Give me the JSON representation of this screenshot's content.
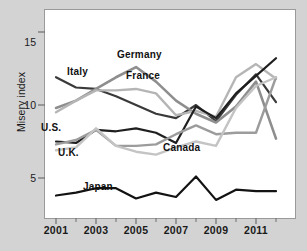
{
  "chart_data": {
    "type": "line",
    "title": "",
    "xlabel": "",
    "ylabel": "Misery index",
    "xlim": [
      2001,
      2012
    ],
    "ylim": [
      2.2,
      16.5
    ],
    "grid": false,
    "legend_position": "inline-labels",
    "x": [
      2001,
      2002,
      2003,
      2004,
      2005,
      2006,
      2007,
      2008,
      2009,
      2010,
      2011,
      2012
    ],
    "xticks": [
      2001,
      2003,
      2005,
      2007,
      2009,
      2011
    ],
    "xtick_labels": [
      "2001",
      "2003",
      "2005",
      "2007",
      "2009",
      "2011"
    ],
    "xminor_ticks": [
      2002,
      2004,
      2006,
      2008,
      2010,
      2012
    ],
    "yticks": [
      5,
      10,
      15
    ],
    "ytick_labels": [
      "5",
      "10",
      "15"
    ],
    "series": [
      {
        "name": "Italy",
        "color": "#3a3a3a",
        "width": 2.2,
        "values": [
          11.9,
          11.2,
          11.1,
          10.6,
          10.0,
          9.4,
          9.1,
          10.0,
          8.9,
          10.7,
          12.1,
          10.2
        ]
      },
      {
        "name": "Germany",
        "color": "#8e8e8e",
        "width": 2.6,
        "values": [
          9.8,
          10.3,
          11.1,
          11.9,
          12.6,
          11.6,
          10.3,
          9.4,
          8.8,
          9.9,
          11.6,
          7.7
        ]
      },
      {
        "name": "France",
        "color": "#b5b5b5",
        "width": 2.4,
        "values": [
          9.5,
          10.3,
          11.0,
          11.0,
          11.1,
          10.8,
          9.3,
          9.6,
          9.2,
          11.9,
          12.8,
          11.8
        ]
      },
      {
        "name": "U.S.",
        "color": "#1f1f1f",
        "width": 2.2,
        "values": [
          7.5,
          7.4,
          8.3,
          8.2,
          8.4,
          8.1,
          7.4,
          9.9,
          9.1,
          10.8,
          12.0,
          13.2
        ]
      },
      {
        "name": "U.K.",
        "color": "#9c9c9c",
        "width": 2.4,
        "values": [
          7.3,
          7.6,
          8.3,
          7.2,
          7.2,
          7.3,
          8.0,
          8.6,
          8.0,
          8.1,
          8.1,
          11.9
        ]
      },
      {
        "name": "Canada",
        "color": "#c4c4c4",
        "width": 2.4,
        "values": [
          6.9,
          7.1,
          8.4,
          7.2,
          6.8,
          6.6,
          7.1,
          7.5,
          7.2,
          9.8,
          11.3,
          11.9
        ]
      },
      {
        "name": "Japan",
        "color": "#131313",
        "width": 2.2,
        "values": [
          3.8,
          4.0,
          4.3,
          4.3,
          3.6,
          4.0,
          3.7,
          5.1,
          3.5,
          4.2,
          4.1,
          4.1
        ]
      }
    ],
    "annotations": [
      {
        "text": "Italy",
        "x": 67,
        "y": 66
      },
      {
        "text": "Germany",
        "x": 117,
        "y": 49
      },
      {
        "text": "France",
        "x": 126,
        "y": 70
      },
      {
        "text": "U.S.",
        "x": 41,
        "y": 122
      },
      {
        "text": "U.K.",
        "x": 58,
        "y": 147
      },
      {
        "text": "Canada",
        "x": 163,
        "y": 142
      },
      {
        "text": "Japan",
        "x": 83,
        "y": 181
      }
    ]
  },
  "axes": {
    "y_axis_title": "Misery index"
  },
  "footer": {
    "source_text": ""
  }
}
